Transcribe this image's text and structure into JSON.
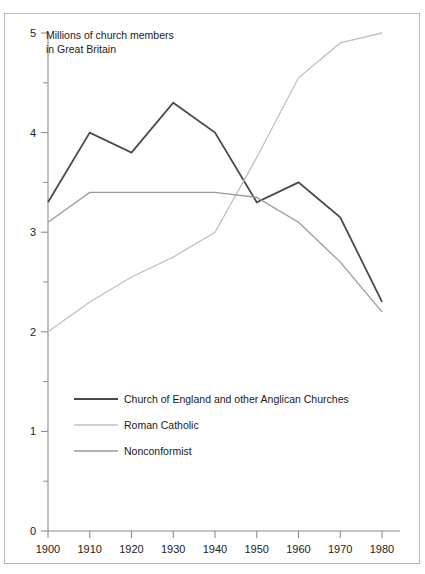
{
  "figure": {
    "title_line1": "Millions of church members",
    "title_line2": "in Great Britain",
    "frame_color": "#b9b9b9",
    "background": "#ffffff"
  },
  "axes": {
    "y_ticks": [
      "0",
      "1",
      "2",
      "3",
      "4",
      "5"
    ],
    "x_ticks": [
      "1900",
      "1910",
      "1920",
      "1930",
      "1940",
      "1950",
      "1960",
      "1970",
      "1980"
    ],
    "axis_color": "#8c8c8c"
  },
  "legend": {
    "items": [
      {
        "label": "Church of England and other Anglican Churches",
        "color": "#4a4a4a"
      },
      {
        "label": "Roman Catholic",
        "color": "#c0c0c0"
      },
      {
        "label": "Nonconformist",
        "color": "#9a9a9a"
      }
    ]
  },
  "chart_data": {
    "type": "line",
    "title": "Millions of church members in Great Britain",
    "xlabel": "",
    "ylabel": "Millions of church members",
    "xlim": [
      1900,
      1980
    ],
    "ylim": [
      0,
      5
    ],
    "grid": false,
    "legend_position": "inside-lower-left",
    "x": [
      1900,
      1910,
      1920,
      1930,
      1940,
      1950,
      1960,
      1970,
      1980
    ],
    "categories": [
      "1900",
      "1910",
      "1920",
      "1930",
      "1940",
      "1950",
      "1960",
      "1970",
      "1980"
    ],
    "y_major_ticks": [
      0,
      1,
      2,
      3,
      4,
      5
    ],
    "y_minor_ticks": [
      0.5,
      1.5,
      2.5,
      3.5,
      4.5
    ],
    "series": [
      {
        "name": "Church of England and other Anglican Churches",
        "color": "#4a4a4a",
        "width": 1.8,
        "values": [
          3.3,
          4.0,
          3.8,
          4.3,
          4.0,
          3.3,
          3.5,
          3.15,
          2.3
        ]
      },
      {
        "name": "Roman Catholic",
        "color": "#c0c0c0",
        "width": 1.3,
        "values": [
          2.0,
          2.3,
          2.55,
          2.75,
          3.0,
          3.75,
          4.55,
          4.9,
          5.0
        ]
      },
      {
        "name": "Nonconformist",
        "color": "#9a9a9a",
        "width": 1.3,
        "values": [
          3.1,
          3.4,
          3.4,
          3.4,
          3.4,
          3.35,
          3.1,
          2.7,
          2.2
        ]
      }
    ]
  }
}
